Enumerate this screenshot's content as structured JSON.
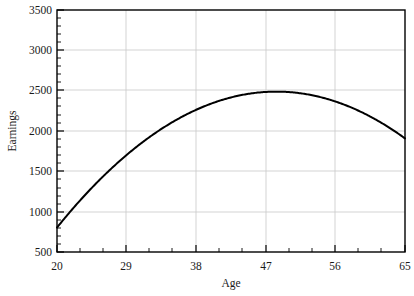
{
  "chart_data": {
    "type": "line",
    "title": "",
    "xlabel": "Age",
    "ylabel": "Earnings",
    "xlim": [
      20,
      65
    ],
    "ylim": [
      500,
      3500
    ],
    "xticks": [
      20,
      29,
      38,
      47,
      56,
      65
    ],
    "xtick_labels": [
      "20",
      "29",
      "38",
      "47",
      "56",
      "65"
    ],
    "yticks": [
      500,
      1000,
      1500,
      2000,
      2500,
      3000,
      3500
    ],
    "ytick_labels": [
      "500",
      "1000",
      "1500",
      "2000",
      "2500",
      "3000",
      "3500"
    ],
    "grid": true,
    "grid_color": "#c8c8c8",
    "legend": null,
    "line_color": "#000000",
    "line_width": 2.0,
    "series": [
      {
        "name": "Earnings",
        "x": [
          20,
          21,
          22,
          23,
          24,
          25,
          26,
          27,
          28,
          29,
          30,
          31,
          32,
          33,
          34,
          35,
          36,
          37,
          38,
          39,
          40,
          41,
          42,
          43,
          44,
          45,
          46,
          47,
          48,
          49,
          50,
          51,
          52,
          53,
          54,
          55,
          56,
          57,
          58,
          59,
          60,
          61,
          62,
          63,
          64,
          65
        ],
        "y": [
          800,
          918,
          1031,
          1140,
          1245,
          1345,
          1441,
          1533,
          1621,
          1704,
          1783,
          1858,
          1929,
          1995,
          2057,
          2115,
          2169,
          2218,
          2263,
          2305,
          2342,
          2374,
          2403,
          2427,
          2448,
          2464,
          2476,
          2483,
          2487,
          2486,
          2482,
          2473,
          2459,
          2442,
          2421,
          2395,
          2365,
          2331,
          2293,
          2251,
          2204,
          2154,
          2099,
          2040,
          1977,
          1910
        ]
      }
    ],
    "curve_description": "quadratic age-earnings profile peaking near age 43"
  },
  "axis": {
    "x_label": "Age",
    "y_label": "Earnings"
  }
}
